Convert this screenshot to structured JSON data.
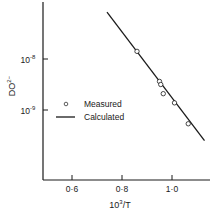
{
  "chart_data": {
    "type": "line",
    "title": "",
    "xlabel": "10³/T",
    "xlabel_base": "10",
    "xlabel_exp": "3",
    "xlabel_rest": "/T",
    "ylabel": "DO²⁻",
    "ylabel_base": "DO",
    "ylabel_sup": "2−",
    "yscale": "log",
    "xlim": [
      0.48,
      1.14
    ],
    "ylim_decades": [
      -9.75,
      -7.05
    ],
    "x_ticks": [
      {
        "value": 0.6,
        "label": "0·6"
      },
      {
        "value": 0.8,
        "label": "0·8"
      },
      {
        "value": 1.0,
        "label": "1·0"
      }
    ],
    "y_ticks": [
      {
        "exp": -8,
        "label_base": "10",
        "label_exp": "-8"
      },
      {
        "exp": -9,
        "label_base": "10",
        "label_exp": "-9"
      }
    ],
    "grid": false,
    "legend_position": "center-left inside",
    "legend": [
      {
        "name": "Measured",
        "marker": "circle"
      },
      {
        "name": "Calculated",
        "marker": "line"
      }
    ],
    "series": [
      {
        "name": "Calculated",
        "style": "line",
        "x": [
          0.74,
          1.13
        ],
        "log10_y": [
          -7.08,
          -9.6
        ]
      },
      {
        "name": "Measured",
        "style": "scatter",
        "x": [
          0.86,
          0.95,
          0.955,
          0.965,
          1.01,
          1.065
        ],
        "log10_y": [
          -7.85,
          -8.44,
          -8.5,
          -8.68,
          -8.86,
          -9.27
        ]
      }
    ]
  },
  "colors": {
    "ink": "#1a1a1a",
    "background": "#ffffff"
  }
}
